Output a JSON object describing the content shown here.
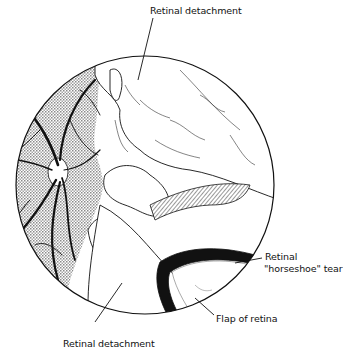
{
  "figure": {
    "labels": {
      "top": "Retinal detachment",
      "tear_line1": "Retinal",
      "tear_line2": "\"horseshoe\" tear",
      "flap": "Flap of retina",
      "bottom": "Retinal detachment"
    },
    "colors": {
      "ink": "#111111",
      "hatch": "#9a9a9a",
      "background": "#ffffff"
    }
  }
}
